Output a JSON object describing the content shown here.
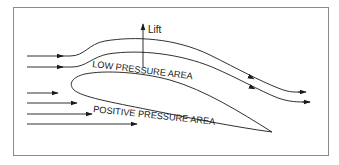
{
  "diagram": {
    "type": "airfoil-pressure-diagram",
    "labels": {
      "lift": "Lift",
      "low_pressure": "LOW PRESSURE AREA",
      "positive_pressure": "POSITIVE PRESSURE AREA"
    },
    "colors": {
      "line": "#1a1a1a",
      "frame": "#8a8a8a",
      "background": "#ffffff"
    },
    "upper_streamlines": 2,
    "lower_inflow_arrows": 4
  }
}
